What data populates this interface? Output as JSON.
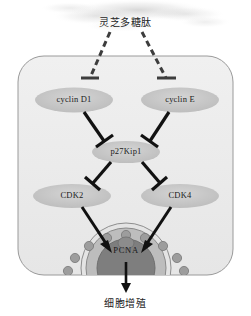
{
  "figure": {
    "title_top": "灵芝多糖肽",
    "title_bottom": "细胞增殖",
    "background_color": "#ffffff",
    "cell_fill_color": "#ededed",
    "cell_border_color": "#9a9a9a",
    "node_fill_color": "#c9c9c9",
    "arrow_color": "#111111",
    "dashed_arrow_color": "#3d3d3d",
    "pcna_ring_color": "#8f8f8f",
    "pcna_core_color": "#7e7e7e"
  },
  "nodes": {
    "cyclin_d1": {
      "label": "cyclin D1",
      "x": 74,
      "y": 100
    },
    "cyclin_e": {
      "label": "cyclin E",
      "x": 180,
      "y": 100
    },
    "p27kip1": {
      "label": "p27Kip1",
      "x": 126,
      "y": 152
    },
    "cdk2": {
      "label": "CDK2",
      "x": 72,
      "y": 196
    },
    "cdk4": {
      "label": "CDK4",
      "x": 180,
      "y": 196
    },
    "pcna": {
      "label": "PCNA",
      "x": 126,
      "y": 251
    }
  },
  "labels": {
    "stimulus": "灵芝多糖肽",
    "outcome": "细胞增殖"
  },
  "edges": [
    {
      "from": "灵芝多糖肽",
      "to": "cyclin D1",
      "type": "inhibition",
      "style": "dashed"
    },
    {
      "from": "灵芝多糖肽",
      "to": "cyclin E",
      "type": "inhibition",
      "style": "dashed"
    },
    {
      "from": "cyclin D1",
      "to": "p27Kip1",
      "type": "inhibition",
      "style": "solid"
    },
    {
      "from": "cyclin E",
      "to": "p27Kip1",
      "type": "inhibition",
      "style": "solid"
    },
    {
      "from": "p27Kip1",
      "to": "CDK2",
      "type": "inhibition",
      "style": "solid"
    },
    {
      "from": "p27Kip1",
      "to": "CDK4",
      "type": "inhibition",
      "style": "solid"
    },
    {
      "from": "CDK2",
      "to": "PCNA",
      "type": "activation",
      "style": "solid"
    },
    {
      "from": "CDK4",
      "to": "PCNA",
      "type": "activation",
      "style": "solid"
    },
    {
      "from": "PCNA",
      "to": "细胞增殖",
      "type": "activation",
      "style": "solid"
    }
  ]
}
